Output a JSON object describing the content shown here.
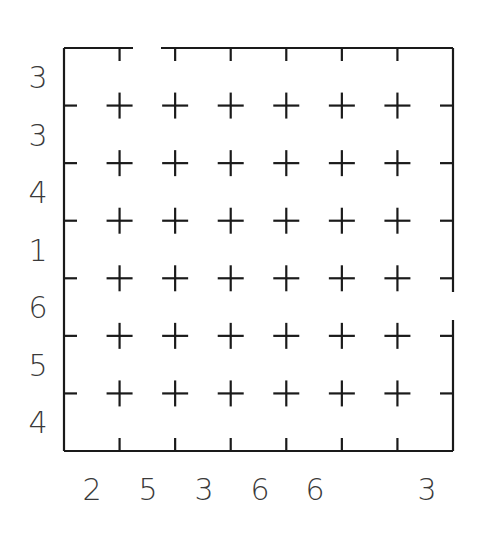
{
  "puzzle": {
    "grid_size": 7,
    "line_color": "#1a1a1a",
    "clue_color": "#3a3a3a",
    "left_clues": [
      "3",
      "3",
      "4",
      "1",
      "6",
      "5",
      "4"
    ],
    "bottom_clues": [
      "2",
      "5",
      "3",
      "6",
      "6",
      "",
      "3"
    ],
    "border_gaps": [
      {
        "side": "top",
        "between_columns": [
          1,
          2
        ]
      },
      {
        "side": "right",
        "between_rows": [
          4,
          5
        ]
      }
    ],
    "intersection_marker": "plus-icon"
  }
}
